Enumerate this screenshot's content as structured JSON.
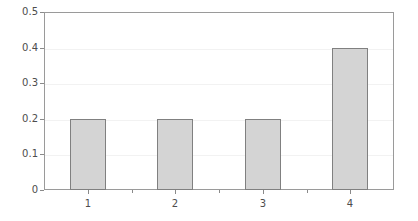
{
  "chart_data": {
    "type": "bar",
    "title": "",
    "xlabel": "",
    "ylabel": "",
    "categories": [
      "1",
      "2",
      "3",
      "4"
    ],
    "values": [
      0.2,
      0.2,
      0.2,
      0.4
    ],
    "ylim": [
      0,
      0.5
    ],
    "yticks": [
      "0",
      "0.1",
      "0.2",
      "0.3",
      "0.4",
      "0.5"
    ],
    "ytick_values": [
      0,
      0.1,
      0.2,
      0.3,
      0.4,
      0.5
    ],
    "xticks": [
      "1",
      "2",
      "3",
      "4"
    ],
    "grid": "horizontal",
    "legend": "none",
    "bar_fill_color": "#d4d4d4",
    "bar_edge_color": "#808080",
    "frame_color": "#9a9a9a",
    "gridline_color": "#f2f2f2",
    "tick_label_color": "#4d4d4d"
  }
}
